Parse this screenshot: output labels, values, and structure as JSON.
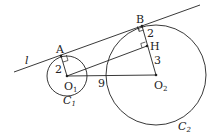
{
  "diagram": {
    "line_label": "l",
    "points": {
      "A": "A",
      "B": "B",
      "H": "H",
      "O1": "O",
      "O1_sub": "1",
      "O2": "O",
      "O2_sub": "2"
    },
    "circles": {
      "C1": "C",
      "C1_sub": "1",
      "C2": "C",
      "C2_sub": "2"
    },
    "lengths": {
      "O1A": "2",
      "BH": "2",
      "HO2": "3",
      "O1O2": "9"
    },
    "colors": {
      "stroke": "#222222",
      "background": "#ffffff"
    }
  }
}
